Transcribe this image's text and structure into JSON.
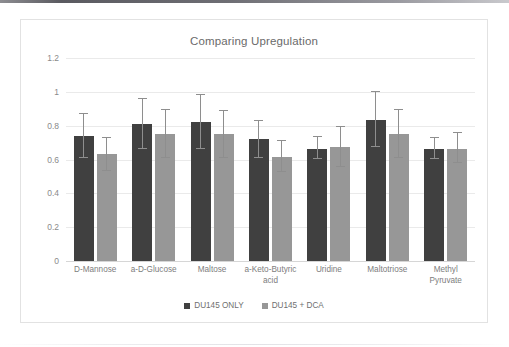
{
  "chart_data": {
    "type": "bar",
    "title": "Comparing Upregulation",
    "xlabel": "",
    "ylabel": "",
    "ylim": [
      0,
      1.2
    ],
    "yticks": [
      0,
      0.2,
      0.4,
      0.6,
      0.8,
      1,
      1.2
    ],
    "ytick_labels": [
      "0",
      "0.2",
      "0.4",
      "0.6",
      "0.8",
      "1",
      "1.2"
    ],
    "grid": true,
    "legend_position": "bottom",
    "categories": [
      "D-Mannose",
      "a-D-Glucose",
      "Maltose",
      "a-Keto-Butyric acid",
      "Uridine",
      "Maltotriose",
      "Methyl Pyruvate"
    ],
    "series": [
      {
        "name": "DU145 ONLY",
        "color": "#404040",
        "values": [
          0.74,
          0.81,
          0.82,
          0.72,
          0.665,
          0.835,
          0.66
        ],
        "error_low": [
          0.61,
          0.66,
          0.66,
          0.61,
          0.605,
          0.675,
          0.605
        ],
        "error_high": [
          0.87,
          0.96,
          0.98,
          0.83,
          0.735,
          1.0,
          0.73
        ]
      },
      {
        "name": "DU145 + DCA",
        "color": "#979797",
        "values": [
          0.63,
          0.75,
          0.75,
          0.615,
          0.675,
          0.75,
          0.665
        ],
        "error_low": [
          0.535,
          0.61,
          0.61,
          0.525,
          0.555,
          0.61,
          0.58
        ],
        "error_high": [
          0.725,
          0.89,
          0.885,
          0.71,
          0.795,
          0.89,
          0.755
        ]
      }
    ]
  },
  "legend": {
    "items": [
      {
        "label": "DU145 ONLY",
        "color": "#404040"
      },
      {
        "label": "DU145 + DCA",
        "color": "#979797"
      }
    ]
  }
}
